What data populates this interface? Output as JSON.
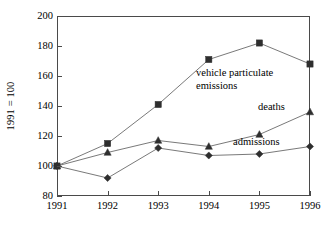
{
  "chart_data": {
    "type": "line",
    "title": "",
    "xlabel": "",
    "ylabel": "1991 = 100",
    "categories": [
      "1991",
      "1992",
      "1993",
      "1994",
      "1995",
      "1996"
    ],
    "x": [
      1991,
      1992,
      1993,
      1994,
      1995,
      1996
    ],
    "ylim": [
      80,
      200
    ],
    "yticks": [
      80,
      100,
      120,
      140,
      160,
      180,
      200
    ],
    "ytick_labels": [
      "80",
      "100",
      "120",
      "140",
      "160",
      "180",
      "200"
    ],
    "grid": false,
    "legend": "none",
    "legend_position": "inline-annotations",
    "series": [
      {
        "name": "vehicle particulate emissions",
        "marker": "square",
        "color": "#3a3a3a",
        "values": [
          100,
          115,
          141,
          171,
          182,
          168
        ]
      },
      {
        "name": "deaths",
        "marker": "triangle",
        "color": "#3a3a3a",
        "values": [
          100,
          109,
          117,
          113,
          121,
          136
        ]
      },
      {
        "name": "admissions",
        "marker": "diamond",
        "color": "#3a3a3a",
        "values": [
          100,
          92,
          112,
          107,
          108,
          113
        ]
      }
    ],
    "annotations": [
      {
        "text": "vehicle particulate\nemissions",
        "series": "vehicle particulate emissions"
      },
      {
        "text": "deaths",
        "series": "deaths"
      },
      {
        "text": "admissions",
        "series": "admissions"
      }
    ]
  },
  "axis": {
    "y_title": "1991 = 100"
  },
  "colors": {
    "frame": "#4a4a4a",
    "line": "#6a6a6a",
    "marker": "#2e2e2e",
    "background": "#ffffff",
    "text": "#000000"
  }
}
